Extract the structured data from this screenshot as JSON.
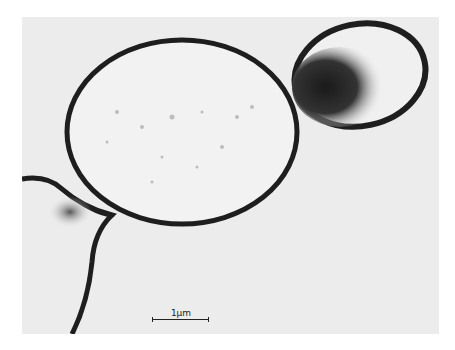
{
  "figure": {
    "type": "transmission electron micrograph",
    "scale_bar": {
      "label": "1µm"
    },
    "colors": {
      "background": "#ececec",
      "wall": "#1e1e1e",
      "dense": "#2a2a2a"
    }
  }
}
